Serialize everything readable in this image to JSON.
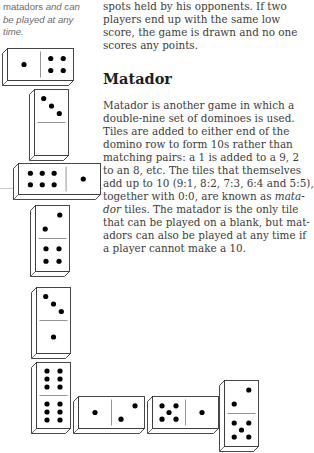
{
  "sidebar_caption": {
    "lines": [
      "matadors and can",
      "be played at any",
      "time."
    ]
  },
  "main_text": {
    "intro_lines": [
      "spots held by his opponents. If two",
      "players end up with the same low",
      "score, the game is drawn and no one",
      "scores any points."
    ],
    "heading": "Matador",
    "body_lines": [
      "Matador is another game in which a",
      "double-nine set of dominoes is used.",
      "Tiles are added to either end of the",
      "domino row to form 10s rather than",
      "matching pairs: a 1 is added to a 9, 2",
      "to an 8, etc. The tiles that themselves",
      "add up to 10 (9:1, 8:2, 7:3, 6:4 and 5:5),",
      "together with 0:0, are known as mata-",
      "dor tiles. The matador is the only tile",
      "that can be played on a blank, but mat-",
      "adors can also be played at any time if",
      "a player cannot make a 10."
    ],
    "italic_fragments": {
      "mata": "mata-",
      "dor": "dor"
    }
  },
  "dominoes": [
    {
      "id": "d1",
      "orientation": "horizontal",
      "left_or_top": 1,
      "right_or_bottom": 4
    },
    {
      "id": "d2",
      "orientation": "vertical",
      "left_or_top": 3,
      "right_or_bottom": 0
    },
    {
      "id": "d3",
      "orientation": "horizontal",
      "left_or_top": 6,
      "right_or_bottom": 1
    },
    {
      "id": "d4",
      "orientation": "vertical",
      "left_or_top": 2,
      "right_or_bottom": 4
    },
    {
      "id": "d5",
      "orientation": "vertical",
      "left_or_top": 3,
      "right_or_bottom": 1
    },
    {
      "id": "d6",
      "orientation": "vertical",
      "left_or_top": 6,
      "right_or_bottom": 6
    },
    {
      "id": "d7",
      "orientation": "horizontal",
      "left_or_top": 1,
      "right_or_bottom": 2
    },
    {
      "id": "d8",
      "orientation": "horizontal",
      "left_or_top": 5,
      "right_or_bottom": 1
    },
    {
      "id": "d9",
      "orientation": "vertical",
      "left_or_top": 2,
      "right_or_bottom": 5
    }
  ],
  "colors": {
    "text": "#3c3c3c",
    "heading": "#1e1e1e",
    "caption": "#6a6a6a",
    "pip": "#000000",
    "outline": "#333333"
  }
}
